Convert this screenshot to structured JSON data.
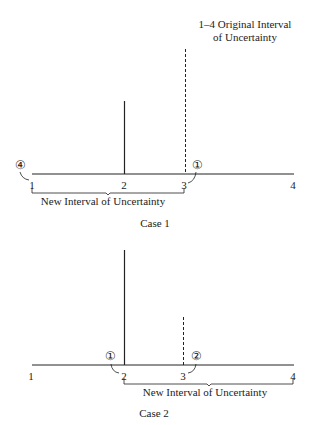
{
  "annotation": {
    "line1": "1–4 Original Interval",
    "line2": "of Uncertainty"
  },
  "case1": {
    "title": "Case 1",
    "ticks": [
      "1",
      "2",
      "3",
      "4"
    ],
    "new_interval_label": "New Interval of Uncertainty",
    "markers": [
      {
        "symbol": "④",
        "at": "1"
      },
      {
        "symbol": "①",
        "at": "3"
      }
    ],
    "solid_line_at": "2",
    "dashed_line_at": "3"
  },
  "case2": {
    "title": "Case 2",
    "ticks": [
      "1",
      "2",
      "3",
      "4"
    ],
    "new_interval_label": "New Interval of Uncertainty",
    "markers": [
      {
        "symbol": "①",
        "at": "2"
      },
      {
        "symbol": "②",
        "at": "3"
      }
    ],
    "solid_line_at": "2",
    "dashed_line_at": "3"
  },
  "colors": {
    "line": "#222222",
    "background": "#ffffff"
  }
}
